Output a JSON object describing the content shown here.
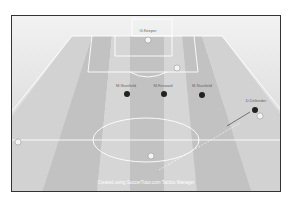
{
  "diagram": {
    "type": "soccer-tactics-board",
    "caption": "Created using SoccerTutor.com Tactics Manager",
    "colors": {
      "pitch_light": "#dcdcdc",
      "pitch_dark": "#c4c4c4",
      "lines": "#ffffff",
      "frame": "#333333",
      "team_dark": "#222222",
      "team_light": "#f4f4f4"
    },
    "labels": {
      "goalkeeper": "G.Keeper",
      "mid_left": "M.Stanfield",
      "mid_center": "M.Forward",
      "mid_right": "M.Stanfield",
      "right_player": "D.Defender"
    }
  }
}
